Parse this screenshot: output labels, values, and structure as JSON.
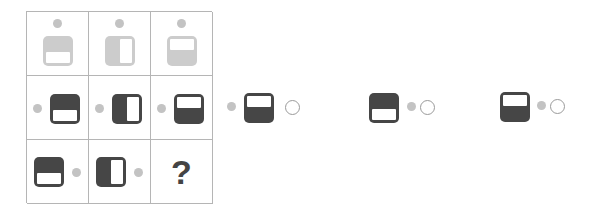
{
  "colors": {
    "grid_line": "#b5b5b5",
    "light_shape": "#cccccc",
    "dark_shape": "#464646",
    "dot": "#c3c3c3",
    "ring_border": "#9a9a9a"
  },
  "puzzle": {
    "rows": [
      [
        {
          "shape": "square-window-bottom",
          "shade": "light",
          "dot": "top"
        },
        {
          "shape": "square-window-right",
          "shade": "light",
          "dot": "top"
        },
        {
          "shape": "square-window-top",
          "shade": "light",
          "dot": "top"
        }
      ],
      [
        {
          "shape": "square-window-bottom",
          "shade": "dark",
          "dot": "left"
        },
        {
          "shape": "square-window-right",
          "shade": "dark",
          "dot": "left"
        },
        {
          "shape": "square-window-top",
          "shade": "dark",
          "dot": "left"
        }
      ],
      [
        {
          "shape": "square-window-bottom",
          "shade": "dark",
          "dot": "right"
        },
        {
          "shape": "square-window-right",
          "shade": "dark",
          "dot": "right"
        },
        {
          "shape": "question-mark",
          "label": "?"
        }
      ]
    ]
  },
  "options": [
    {
      "shape": "square-window-top",
      "shade": "dark",
      "dot": "left",
      "radio": "unselected"
    },
    {
      "shape": "square-window-bottom",
      "shade": "dark",
      "dot": "right",
      "radio": "unselected"
    },
    {
      "shape": "square-window-top",
      "shade": "dark",
      "dot": "right",
      "radio": "unselected"
    }
  ],
  "missing_label": "?"
}
